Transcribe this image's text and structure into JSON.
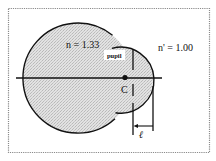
{
  "figure": {
    "labels": {
      "n_inside": "n = 1.33",
      "n_outside": "n' = 1.00",
      "pupil": "pupil",
      "center_point": "C",
      "distance": "ℓ"
    },
    "colors": {
      "frame": "#8a8a8a",
      "fill": "#d8d8d8",
      "stroke": "#111111",
      "background": "#ffffff"
    }
  }
}
